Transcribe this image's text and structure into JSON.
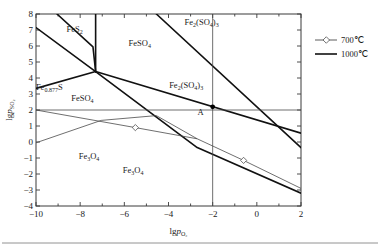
{
  "chart_data": {
    "type": "line",
    "title": "",
    "xlabel": "lg p_O2",
    "xlabel_main": "lg",
    "xlabel_p": "p",
    "xlabel_sub": "O₂",
    "ylabel": "lg p_SO2",
    "ylabel_main": "lg",
    "ylabel_p": "p",
    "ylabel_sub": "SO₂",
    "xlim": [
      -10,
      2
    ],
    "ylim": [
      -4,
      8
    ],
    "xticks": [
      -10,
      -8,
      -6,
      -4,
      -2,
      0,
      2
    ],
    "xtick_labels": [
      "−10",
      "−8",
      "−6",
      "−4",
      "−2",
      "0",
      "2"
    ],
    "xminor": [
      -9,
      -7,
      -5,
      -3,
      -1,
      1
    ],
    "yticks": [
      -4,
      -3,
      -2,
      -1,
      0,
      1,
      2,
      3,
      4,
      5,
      6,
      7,
      8
    ],
    "ytick_labels": [
      "−4",
      "−3",
      "−2",
      "−1",
      "0",
      "1",
      "2",
      "3",
      "4",
      "5",
      "6",
      "7",
      "8"
    ],
    "grid": false,
    "legend_position": "outside-right-top",
    "legend": [
      {
        "name": "700℃",
        "style": "line-with-marker",
        "marker": "open-square",
        "color": "#4a4a4a"
      },
      {
        "name": "1000℃",
        "style": "line",
        "marker": "none",
        "color": "#111111"
      }
    ],
    "annotations": [
      {
        "label": "A",
        "x": -2.0,
        "y": 2.2,
        "point": true
      }
    ],
    "phase_labels": [
      {
        "text": "FeS",
        "sub": "2",
        "x": -8.25,
        "y": 6.85
      },
      {
        "text": "FeSO",
        "sub": "4",
        "x": -5.3,
        "y": 6.0
      },
      {
        "text": "Fe",
        "sub": "2",
        "text2": "(SO",
        "sub2": "4",
        "text3": ")",
        "sub3": "3",
        "x": -2.5,
        "y": 7.3
      },
      {
        "text": "Fe",
        "sub": "2",
        "text2": "(SO",
        "sub2": "4",
        "text3": ")",
        "sub3": "3",
        "x": -3.2,
        "y": 3.35
      },
      {
        "text": "Fe",
        "sub": "0.877",
        "text2": "S",
        "x": -9.4,
        "y": 3.25
      },
      {
        "text": "FeSO",
        "sub": "4",
        "x": -7.9,
        "y": 2.55
      },
      {
        "text": "Fe",
        "sub": "3",
        "text2": "O",
        "sub2": "4",
        "x": -7.6,
        "y": -1.05
      },
      {
        "text": "Fe",
        "sub": "3",
        "text2": "O",
        "sub2": "4",
        "x": -5.6,
        "y": -1.95
      }
    ],
    "series": [
      {
        "name": "1000℃ FeS2 / Fe0.877S boundary",
        "temperature": "1000℃",
        "points": [
          [
            -10,
            7.15
          ],
          [
            -7.3,
            4.4
          ]
        ]
      },
      {
        "name": "1000℃ Fe0.877S lower boundary",
        "temperature": "1000℃",
        "points": [
          [
            -10,
            3.35
          ],
          [
            -7.3,
            4.4
          ]
        ]
      },
      {
        "name": "1000℃ FeS2 vertical / FeSO4 boundary",
        "temperature": "1000℃",
        "points": [
          [
            -7.3,
            8.0
          ],
          [
            -7.3,
            4.4
          ]
        ]
      },
      {
        "name": "1000℃ upper FeS2-FeSO4 ridge",
        "temperature": "1000℃",
        "points": [
          [
            -9.05,
            8.0
          ],
          [
            -7.42,
            5.95
          ],
          [
            -7.3,
            4.4
          ]
        ]
      },
      {
        "name": "1000℃ FeSO4 / Fe2(SO4)3 boundary upper",
        "temperature": "1000℃",
        "points": [
          [
            -7.3,
            4.4
          ],
          [
            2.0,
            0.55
          ]
        ]
      },
      {
        "name": "1000℃ Fe2(SO4)3 upper divider",
        "temperature": "1000℃",
        "points": [
          [
            -4.55,
            8.0
          ],
          [
            2.0,
            -0.35
          ]
        ]
      },
      {
        "name": "1000℃ FeSO4 / Fe3O4 boundary",
        "temperature": "1000℃",
        "points": [
          [
            -7.3,
            4.4
          ],
          [
            -2.7,
            -0.35
          ],
          [
            2.0,
            -3.2
          ]
        ]
      },
      {
        "name": "700℃ upper boundary horizontal",
        "temperature": "700℃",
        "points": [
          [
            -10,
            2.0
          ],
          [
            -2.0,
            2.0
          ],
          [
            2.0,
            2.0
          ]
        ]
      },
      {
        "name": "700℃ vertical boundary at x=-2",
        "temperature": "700℃",
        "points": [
          [
            -2.0,
            8.0
          ],
          [
            -2.0,
            -4.0
          ]
        ]
      },
      {
        "name": "700℃ descending line with markers",
        "temperature": "700℃",
        "points": [
          [
            -10,
            2.0
          ],
          [
            -5.5,
            0.9
          ],
          [
            -2.7,
            0.2
          ],
          [
            -0.6,
            -1.15
          ],
          [
            2.0,
            -2.9
          ]
        ],
        "markers": [
          [
            -5.5,
            0.9
          ],
          [
            -0.6,
            -1.15
          ]
        ]
      },
      {
        "name": "700℃ rising line from lower left",
        "temperature": "700℃",
        "points": [
          [
            -10,
            -0.05
          ],
          [
            -7.05,
            1.35
          ],
          [
            -4.55,
            1.65
          ]
        ]
      },
      {
        "name": "700℃ short descent to corner",
        "temperature": "700℃",
        "points": [
          [
            -4.55,
            1.65
          ],
          [
            -2.7,
            0.2
          ]
        ]
      }
    ]
  },
  "footer": {
    "rule": true
  }
}
